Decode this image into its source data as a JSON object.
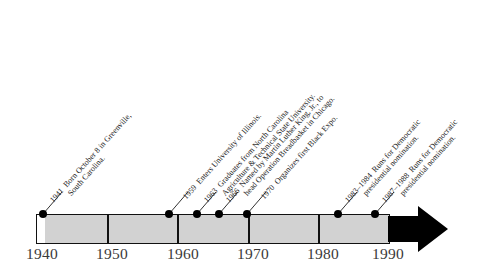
{
  "figure": {
    "name": "jesse-jackson-life-timeline",
    "orientation": "horizontal",
    "colors": {
      "bar_fill": "#d2d2d2",
      "outline": "#111111",
      "arrow": "#000000",
      "text": "#1b1b1b",
      "tick_text": "#3a3a3a",
      "background": "#ffffff"
    }
  },
  "axis": {
    "start_year": 1940,
    "end_year": 1990,
    "ticks": [
      {
        "label": "1940",
        "year": 1940
      },
      {
        "label": "1950",
        "year": 1950
      },
      {
        "label": "1960",
        "year": 1960
      },
      {
        "label": "1970",
        "year": 1970
      },
      {
        "label": "1980",
        "year": 1980
      },
      {
        "label": "1990",
        "year": 1990
      }
    ],
    "arrow_direction": "right"
  },
  "events": [
    {
      "year": 1941,
      "year_label": "1941",
      "line1": "Born October 8 in Greenville,",
      "line2": "South Carolina."
    },
    {
      "year": 1959,
      "year_label": "1959",
      "line1": "Enters University of Illinois.",
      "line2": ""
    },
    {
      "year": 1963,
      "year_label": "1963",
      "line1": "Graduates from North Carolina",
      "line2": "Agriculture & Technical State University."
    },
    {
      "year": 1966,
      "year_label": "1966",
      "line1": "Named by Martin Luther King, Jr., to",
      "line2": "head Operation Breadbasket in Chicago."
    },
    {
      "year": 1970,
      "year_label": "1970",
      "line1": "Organizes first Black Expo.",
      "line2": ""
    },
    {
      "year": 1983,
      "year_label": "1983–1984",
      "line1": "Runs for Democratic",
      "line2": "presidential nomination."
    },
    {
      "year": 1987,
      "year_label": "1987–1988",
      "line1": "Runs for Democratic",
      "line2": "presidential nomination."
    }
  ]
}
